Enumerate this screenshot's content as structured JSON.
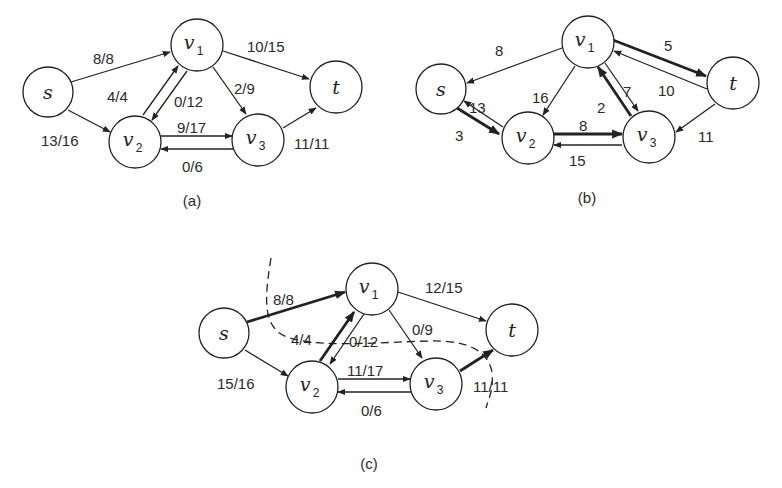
{
  "figure": {
    "panels": [
      {
        "id": "a",
        "caption": "(a)",
        "nodes": [
          {
            "id": "s",
            "label": "s",
            "sub": ""
          },
          {
            "id": "v1",
            "label": "v",
            "sub": "1"
          },
          {
            "id": "v2",
            "label": "v",
            "sub": "2"
          },
          {
            "id": "v3",
            "label": "v",
            "sub": "3"
          },
          {
            "id": "t",
            "label": "t",
            "sub": ""
          }
        ],
        "edges": [
          {
            "from": "s",
            "to": "v1",
            "label": "8/8"
          },
          {
            "from": "s",
            "to": "v2",
            "label": "13/16"
          },
          {
            "from": "v2",
            "to": "v1",
            "label": "4/4"
          },
          {
            "from": "v1",
            "to": "v2",
            "label": "0/12"
          },
          {
            "from": "v1",
            "to": "v3",
            "label": "2/9"
          },
          {
            "from": "v1",
            "to": "t",
            "label": "10/15"
          },
          {
            "from": "v2",
            "to": "v3",
            "label": "9/17"
          },
          {
            "from": "v3",
            "to": "v2",
            "label": "0/6"
          },
          {
            "from": "v3",
            "to": "t",
            "label": "11/11"
          }
        ]
      },
      {
        "id": "b",
        "caption": "(b)",
        "nodes": [
          {
            "id": "s",
            "label": "s",
            "sub": ""
          },
          {
            "id": "v1",
            "label": "v",
            "sub": "1"
          },
          {
            "id": "v2",
            "label": "v",
            "sub": "2"
          },
          {
            "id": "v3",
            "label": "v",
            "sub": "3"
          },
          {
            "id": "t",
            "label": "t",
            "sub": ""
          }
        ],
        "edges": [
          {
            "from": "v1",
            "to": "s",
            "label": "8"
          },
          {
            "from": "v2",
            "to": "s",
            "label": "13"
          },
          {
            "from": "s",
            "to": "v2",
            "label": "3",
            "highlight": true
          },
          {
            "from": "v1",
            "to": "v2",
            "label": "16"
          },
          {
            "from": "v1",
            "to": "t",
            "label": "5",
            "highlight": true
          },
          {
            "from": "t",
            "to": "v1",
            "label": "10"
          },
          {
            "from": "v1",
            "to": "v3",
            "label": "7"
          },
          {
            "from": "v3",
            "to": "v1",
            "label": "2",
            "highlight": true
          },
          {
            "from": "v2",
            "to": "v3",
            "label": "8",
            "highlight": true
          },
          {
            "from": "v3",
            "to": "v2",
            "label": "15"
          },
          {
            "from": "t",
            "to": "v3",
            "label": "11"
          }
        ]
      },
      {
        "id": "c",
        "caption": "(c)",
        "nodes": [
          {
            "id": "s",
            "label": "s",
            "sub": ""
          },
          {
            "id": "v1",
            "label": "v",
            "sub": "1"
          },
          {
            "id": "v2",
            "label": "v",
            "sub": "2"
          },
          {
            "id": "v3",
            "label": "v",
            "sub": "3"
          },
          {
            "id": "t",
            "label": "t",
            "sub": ""
          }
        ],
        "edges": [
          {
            "from": "s",
            "to": "v1",
            "label": "8/8",
            "highlight": true
          },
          {
            "from": "s",
            "to": "v2",
            "label": "15/16"
          },
          {
            "from": "v2",
            "to": "v1",
            "label": "4/4",
            "highlight": true
          },
          {
            "from": "v1",
            "to": "v2",
            "label": "0/12"
          },
          {
            "from": "v1",
            "to": "v3",
            "label": "0/9"
          },
          {
            "from": "v1",
            "to": "t",
            "label": "12/15"
          },
          {
            "from": "v2",
            "to": "v3",
            "label": "11/17"
          },
          {
            "from": "v3",
            "to": "v2",
            "label": "0/6"
          },
          {
            "from": "v3",
            "to": "t",
            "label": "11/11",
            "highlight": true
          }
        ],
        "cut": "dashed minimum cut curve"
      }
    ]
  }
}
